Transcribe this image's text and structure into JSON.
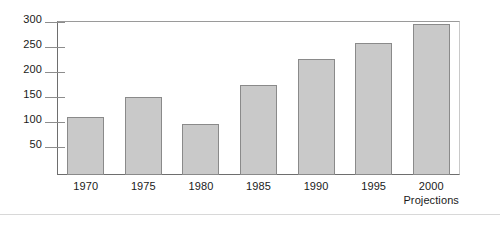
{
  "chart_data": {
    "type": "bar",
    "title": "",
    "subtitle": "",
    "xlabel": "",
    "ylabel": "",
    "categories": [
      "1970",
      "1975",
      "1980",
      "1985",
      "1990",
      "1995",
      "2000"
    ],
    "values": [
      113,
      152,
      100,
      176,
      228,
      258,
      297
    ],
    "series": [
      {
        "name": "",
        "values": [
          113,
          152,
          100,
          176,
          228,
          258,
          297
        ]
      }
    ],
    "ylim": [
      0,
      310
    ],
    "yticks": [
      50,
      100,
      150,
      200,
      250,
      300
    ],
    "ytick_labels": [
      "50",
      "100",
      "150",
      "200",
      "250",
      "300"
    ],
    "grid": false,
    "legend": false,
    "legend_position": "none",
    "annotations": [
      {
        "text": "Projections",
        "anchor_category": "2000",
        "position": "below-last-category-label"
      }
    ],
    "bar_fill_color": "#c9c9c9",
    "bar_border_color": "#8a8a8a",
    "axis_color": "#6e6e6e",
    "text_color": "#1a1a1a"
  },
  "axis": {
    "y_tick_labels": [
      "300",
      "250",
      "200",
      "150",
      "100",
      "50"
    ],
    "x_tick_labels": [
      "1970",
      "1975",
      "1980",
      "1985",
      "1990",
      "1995",
      "2000"
    ],
    "footnote": "Projections"
  }
}
